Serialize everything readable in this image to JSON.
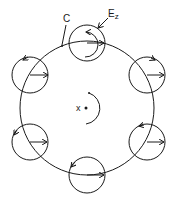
{
  "labels": {
    "contour": "C",
    "field_main": "E",
    "field_sub": "z",
    "center": "x"
  },
  "colors": {
    "stroke": "#1a1a1a",
    "background": "#ffffff"
  }
}
